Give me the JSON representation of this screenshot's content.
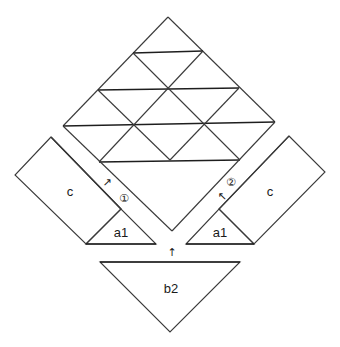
{
  "diagram": {
    "type": "geometric dissection",
    "grid": {
      "description": "Triangular grid inside upper half of a diamond",
      "rows": 4
    },
    "pieces": {
      "left_rect": {
        "label": "c"
      },
      "left_triangle": {
        "label": "a1"
      },
      "right_rect": {
        "label": "c"
      },
      "right_triangle": {
        "label": "a1"
      },
      "bottom_triangle": {
        "label": "b2"
      }
    },
    "markers": {
      "left": "①",
      "right": "②"
    },
    "arrows": {
      "left": "↗",
      "right": "↖",
      "bottom": "↑"
    },
    "colors": {
      "line": "#3a3a3a",
      "background": "#ffffff"
    }
  }
}
